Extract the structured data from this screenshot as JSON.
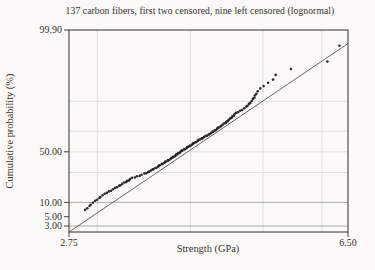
{
  "chart_data": {
    "type": "scatter",
    "subtype": "lognormal-probability-plot",
    "title": "137 carbon fibers, first two censored, nine left censored (lognormal)",
    "xlabel": "Strength (GPa)",
    "ylabel": "Cumulative probability (%)",
    "x_scale": "log",
    "y_scale": "normal-probability-percent",
    "x_range": [
      2.75,
      6.5
    ],
    "y_range_percent": [
      2.1,
      99.9
    ],
    "x_tick_labels": [
      "2.75",
      "6.50"
    ],
    "x_tick_values": [
      2.75,
      6.5
    ],
    "y_tick_labels": [
      "99.90",
      "50.00",
      "10.00",
      "5.00",
      "3.00"
    ],
    "y_tick_values": [
      99.9,
      50,
      10,
      5,
      3
    ],
    "x_gridlines": [
      3,
      4,
      5,
      6
    ],
    "y_gridlines_minor_percent": [
      90,
      70,
      50,
      30
    ],
    "y_gridlines_major_percent": [
      10,
      3
    ],
    "grid": true,
    "legend": null,
    "fit_line": {
      "x1_gpa": 2.75,
      "p1_percent": 2.1,
      "x2_gpa": 6.5,
      "p2_percent": 99.7
    },
    "colors": {
      "background": "#fbfaf7",
      "point": "#23211d",
      "fit_line": "#56544f",
      "frame": "#45433f",
      "grid_minor": "#dcddda",
      "grid_major": "#aaada9",
      "text": "#343330"
    },
    "points": [
      [
        2.89,
        6.93
      ],
      [
        2.91,
        7.66
      ],
      [
        2.93,
        8.39
      ],
      [
        2.94,
        9.12
      ],
      [
        2.96,
        9.85
      ],
      [
        2.98,
        10.58
      ],
      [
        3.0,
        11.31
      ],
      [
        3.02,
        12.04
      ],
      [
        3.03,
        12.77
      ],
      [
        3.05,
        13.5
      ],
      [
        3.07,
        14.23
      ],
      [
        3.09,
        14.96
      ],
      [
        3.11,
        15.69
      ],
      [
        3.13,
        16.42
      ],
      [
        3.15,
        17.15
      ],
      [
        3.17,
        17.88
      ],
      [
        3.19,
        18.61
      ],
      [
        3.21,
        19.34
      ],
      [
        3.22,
        20.07
      ],
      [
        3.24,
        20.8
      ],
      [
        3.26,
        21.53
      ],
      [
        3.28,
        22.26
      ],
      [
        3.29,
        22.99
      ],
      [
        3.31,
        23.72
      ],
      [
        3.32,
        24.45
      ],
      [
        3.34,
        25.18
      ],
      [
        3.37,
        25.91
      ],
      [
        3.39,
        26.64
      ],
      [
        3.42,
        27.37
      ],
      [
        3.44,
        28.1
      ],
      [
        3.47,
        28.83
      ],
      [
        3.49,
        29.56
      ],
      [
        3.51,
        30.29
      ],
      [
        3.52,
        31.02
      ],
      [
        3.54,
        31.75
      ],
      [
        3.56,
        32.48
      ],
      [
        3.57,
        33.21
      ],
      [
        3.59,
        33.94
      ],
      [
        3.6,
        34.67
      ],
      [
        3.62,
        35.4
      ],
      [
        3.63,
        36.13
      ],
      [
        3.64,
        36.86
      ],
      [
        3.66,
        37.59
      ],
      [
        3.67,
        38.32
      ],
      [
        3.69,
        39.05
      ],
      [
        3.7,
        39.78
      ],
      [
        3.71,
        40.51
      ],
      [
        3.73,
        41.24
      ],
      [
        3.74,
        41.97
      ],
      [
        3.76,
        42.7
      ],
      [
        3.77,
        43.43
      ],
      [
        3.78,
        44.16
      ],
      [
        3.79,
        44.89
      ],
      [
        3.81,
        45.62
      ],
      [
        3.82,
        46.35
      ],
      [
        3.83,
        47.08
      ],
      [
        3.84,
        47.81
      ],
      [
        3.85,
        48.54
      ],
      [
        3.87,
        49.27
      ],
      [
        3.88,
        50.0
      ],
      [
        3.89,
        50.73
      ],
      [
        3.9,
        51.46
      ],
      [
        3.92,
        52.19
      ],
      [
        3.93,
        52.92
      ],
      [
        3.95,
        53.65
      ],
      [
        3.96,
        54.38
      ],
      [
        3.97,
        55.11
      ],
      [
        3.99,
        55.84
      ],
      [
        4.0,
        56.57
      ],
      [
        4.02,
        57.3
      ],
      [
        4.03,
        58.03
      ],
      [
        4.04,
        58.76
      ],
      [
        4.06,
        59.49
      ],
      [
        4.07,
        60.22
      ],
      [
        4.09,
        60.95
      ],
      [
        4.1,
        61.68
      ],
      [
        4.12,
        62.41
      ],
      [
        4.14,
        63.14
      ],
      [
        4.15,
        63.87
      ],
      [
        4.17,
        64.6
      ],
      [
        4.19,
        65.33
      ],
      [
        4.21,
        66.06
      ],
      [
        4.23,
        66.79
      ],
      [
        4.24,
        67.52
      ],
      [
        4.26,
        68.25
      ],
      [
        4.28,
        68.98
      ],
      [
        4.29,
        69.71
      ],
      [
        4.31,
        70.44
      ],
      [
        4.32,
        71.17
      ],
      [
        4.34,
        71.9
      ],
      [
        4.35,
        72.63
      ],
      [
        4.37,
        73.36
      ],
      [
        4.39,
        74.09
      ],
      [
        4.4,
        74.82
      ],
      [
        4.42,
        75.55
      ],
      [
        4.44,
        76.28
      ],
      [
        4.46,
        77.01
      ],
      [
        4.47,
        77.74
      ],
      [
        4.49,
        78.47
      ],
      [
        4.5,
        79.2
      ],
      [
        4.52,
        79.93
      ],
      [
        4.54,
        80.66
      ],
      [
        4.55,
        81.39
      ],
      [
        4.57,
        82.12
      ],
      [
        4.58,
        82.85
      ],
      [
        4.6,
        83.58
      ],
      [
        4.63,
        84.31
      ],
      [
        4.66,
        85.04
      ],
      [
        4.69,
        85.77
      ],
      [
        4.72,
        86.5
      ],
      [
        4.75,
        87.23
      ],
      [
        4.77,
        87.96
      ],
      [
        4.79,
        88.69
      ],
      [
        4.81,
        89.42
      ],
      [
        4.83,
        90.15
      ],
      [
        4.85,
        90.88
      ],
      [
        4.87,
        91.61
      ],
      [
        4.88,
        92.34
      ],
      [
        4.9,
        93.07
      ],
      [
        4.92,
        93.8
      ],
      [
        4.96,
        94.53
      ],
      [
        5.01,
        95.26
      ],
      [
        5.08,
        95.99
      ],
      [
        5.16,
        96.72
      ],
      [
        5.2,
        97.45
      ],
      [
        5.45,
        98.18
      ],
      [
        6.1,
        98.91
      ],
      [
        6.33,
        99.64
      ]
    ]
  }
}
